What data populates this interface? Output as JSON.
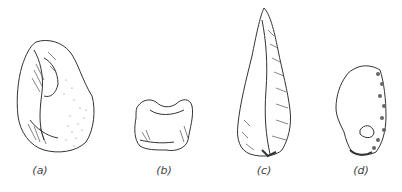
{
  "figure": {
    "items": [
      {
        "id": "a",
        "label": "(a)",
        "description": "stone tool flake with cortex"
      },
      {
        "id": "b",
        "label": "(b)",
        "description": "notched flake tool"
      },
      {
        "id": "c",
        "label": "(c)",
        "description": "pointed handaxe / point"
      },
      {
        "id": "d",
        "label": "(d)",
        "description": "side scraper with retouched edge"
      }
    ],
    "colors": {
      "ink": "#333333",
      "background": "#ffffff"
    }
  }
}
